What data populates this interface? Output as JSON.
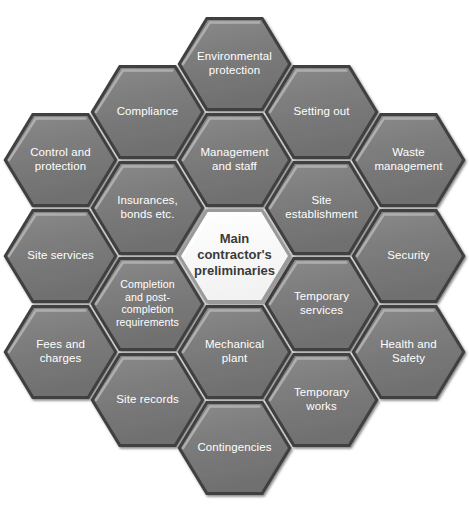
{
  "diagram": {
    "type": "hexagon-honeycomb",
    "background_color": "#ffffff",
    "hex_fill_color": "#7d7d7d",
    "hex_edge_dark": "#3f3f3f",
    "hex_highlight_color": "#b6b6b6",
    "hex_label_color": "#ffffff",
    "center_fill_color": "#ffffff",
    "center_label_color": "#3a3a3a",
    "center": {
      "id": "main-contractors-preliminaries",
      "lines": [
        "Main",
        "contractor's",
        "preliminaries"
      ],
      "label": "Main contractor's preliminaries"
    },
    "cells": [
      {
        "id": "environmental-protection",
        "label": "Environmental protection",
        "lines": [
          "Environmental",
          "protection"
        ],
        "col": 0,
        "row": -2
      },
      {
        "id": "compliance",
        "label": "Compliance",
        "lines": [
          "Compliance"
        ],
        "col": -1,
        "row": -1.5
      },
      {
        "id": "setting-out",
        "label": "Setting out",
        "lines": [
          "Setting out"
        ],
        "col": 1,
        "row": -1.5
      },
      {
        "id": "control-and-protection",
        "label": "Control and protection",
        "lines": [
          "Control and",
          "protection"
        ],
        "col": -2,
        "row": -1
      },
      {
        "id": "management-and-staff",
        "label": "Management and staff",
        "lines": [
          "Management",
          "and staff"
        ],
        "col": 0,
        "row": -1
      },
      {
        "id": "waste-management",
        "label": "Waste management",
        "lines": [
          "Waste",
          "management"
        ],
        "col": 2,
        "row": -1
      },
      {
        "id": "insurances-bonds-etc",
        "label": "Insurances, bonds etc.",
        "lines": [
          "Insurances,",
          "bonds etc."
        ],
        "col": -1,
        "row": -0.5
      },
      {
        "id": "site-establishment",
        "label": "Site establishment",
        "lines": [
          "Site",
          "establishment"
        ],
        "col": 1,
        "row": -0.5
      },
      {
        "id": "site-services",
        "label": "Site services",
        "lines": [
          "Site services"
        ],
        "col": -2,
        "row": 0
      },
      {
        "id": "security",
        "label": "Security",
        "lines": [
          "Security"
        ],
        "col": 2,
        "row": 0
      },
      {
        "id": "completion-and-post-completion-requirements",
        "label": "Completion and post-completion requirements",
        "lines": [
          "Completion",
          "and post-",
          "completion",
          "requirements"
        ],
        "col": -1,
        "row": 0.5
      },
      {
        "id": "temporary-services",
        "label": "Temporary services",
        "lines": [
          "Temporary",
          "services"
        ],
        "col": 1,
        "row": 0.5
      },
      {
        "id": "fees-and-charges",
        "label": "Fees and charges",
        "lines": [
          "Fees and",
          "charges"
        ],
        "col": -2,
        "row": 1
      },
      {
        "id": "mechanical-plant",
        "label": "Mechanical plant",
        "lines": [
          "Mechanical",
          "plant"
        ],
        "col": 0,
        "row": 1
      },
      {
        "id": "health-and-safety",
        "label": "Health and Safety",
        "lines": [
          "Health and",
          "Safety"
        ],
        "col": 2,
        "row": 1
      },
      {
        "id": "site-records",
        "label": "Site records",
        "lines": [
          "Site records"
        ],
        "col": -1,
        "row": 1.5
      },
      {
        "id": "temporary-works",
        "label": "Temporary works",
        "lines": [
          "Temporary",
          "works"
        ],
        "col": 1,
        "row": 1.5
      },
      {
        "id": "contingencies",
        "label": "Contingencies",
        "lines": [
          "Contingencies"
        ],
        "col": 0,
        "row": 2
      }
    ]
  }
}
